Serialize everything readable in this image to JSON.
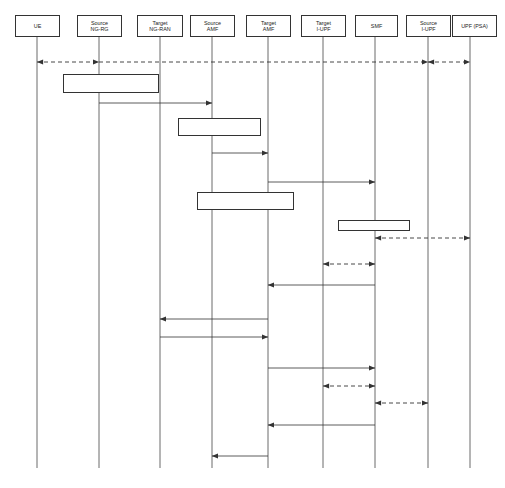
{
  "diagram": {
    "type": "uml-sequence-diagram",
    "caption": "",
    "lifelines": [
      {
        "id": "ue",
        "label": "UE",
        "line2": "",
        "x": 37,
        "box_x": 15,
        "box_w": 45
      },
      {
        "id": "src_ngrg",
        "label": "Source",
        "line2": "NG-RG",
        "x": 99,
        "box_x": 77,
        "box_w": 45
      },
      {
        "id": "tgt_ngran",
        "label": "Target",
        "line2": "NG-RAN",
        "x": 160,
        "box_x": 137,
        "box_w": 46
      },
      {
        "id": "src_amf",
        "label": "Source",
        "line2": "AMF",
        "x": 212,
        "box_x": 190,
        "box_w": 45
      },
      {
        "id": "tgt_amf",
        "label": "Target",
        "line2": "AMF",
        "x": 268,
        "box_x": 246,
        "box_w": 45
      },
      {
        "id": "tgt_iupf",
        "label": "Target",
        "line2": "I-UPF",
        "x": 323,
        "box_x": 301,
        "box_w": 45
      },
      {
        "id": "smf",
        "label": "SMF",
        "line2": "",
        "x": 375,
        "box_x": 355,
        "box_w": 43
      },
      {
        "id": "src_iupf",
        "label": "Source",
        "line2": "I-UPF",
        "x": 428,
        "box_x": 406,
        "box_w": 45
      },
      {
        "id": "upf_psa",
        "label": "UPF (PSA)",
        "line2": "",
        "x": 470,
        "box_x": 452,
        "box_w": 45
      }
    ],
    "steps": [
      {
        "id": "A",
        "label": "(A)",
        "x": 18,
        "y": 94
      },
      {
        "id": "B",
        "label": "(B)",
        "x": 165,
        "y": 131
      },
      {
        "id": "C",
        "label": "(C)",
        "x": 220,
        "y": 178
      },
      {
        "id": "D",
        "label": "(D)",
        "x": 228,
        "y": 249
      },
      {
        "id": "E",
        "label": "(E)",
        "x": 118,
        "y": 318
      },
      {
        "id": "F",
        "label": "(F)",
        "x": 228,
        "y": 389
      },
      {
        "id": "G",
        "label": "(G)",
        "x": 196,
        "y": 434
      }
    ],
    "notes": [
      {
        "id": "decision-note",
        "text": "Decision to trigger handover via N2",
        "x": 63,
        "y": 74,
        "w": 96,
        "h": 19
      },
      {
        "id": "selection-note",
        "text": "Selection of target AMF",
        "x": 178,
        "y": 118,
        "w": 83,
        "h": 18
      },
      {
        "id": "supervision-note",
        "text": "PDU Session handover supervision",
        "x": 197,
        "y": 192,
        "w": 97,
        "h": 18
      },
      {
        "id": "iupf-note",
        "text": "I-UPF selection",
        "x": 338,
        "y": 220,
        "w": 72,
        "h": 11
      }
    ],
    "messages": [
      {
        "id": "m-userplane",
        "text": "Downlink / uplink user plane data",
        "label_x": 213,
        "label_y": 49,
        "y": 62,
        "style": "dashed",
        "segments": "userplane"
      },
      {
        "id": "m-ho-req",
        "text": "Handover Required",
        "label_x": 112,
        "label_y": 95,
        "y": 103,
        "from": "src_ngrg",
        "to": "src_amf",
        "style": "solid",
        "dir": "right"
      },
      {
        "id": "m-createue-req",
        "text": "Namf_Communication_CreateUEContext Request",
        "label_x": 182,
        "label_y": 145,
        "y": 153,
        "from": "src_amf",
        "to": "tgt_amf",
        "style": "solid",
        "dir": "right"
      },
      {
        "id": "m-pdu-upd-req1",
        "text": "Nsmf_PDUSession_UpdateSMContext Request",
        "label_x": 265,
        "label_y": 174,
        "y": 182,
        "from": "tgt_amf",
        "to": "smf",
        "style": "solid",
        "dir": "right"
      },
      {
        "id": "m-n4-mod-psa",
        "text": "N4 Session Modification",
        "label_x": 385,
        "label_y": 229,
        "y": 238,
        "from": "smf",
        "to": "upf_psa",
        "style": "dashed",
        "dir": "both"
      },
      {
        "id": "m-n4-estab",
        "text": "N4 Session Establishment",
        "label_x": 308,
        "label_y": 255,
        "y": 264,
        "from": "tgt_iupf",
        "to": "smf",
        "style": "dashed",
        "dir": "both"
      },
      {
        "id": "m-pdu-upd-resp1",
        "text": "Nsmf_PDUSession_UpdateSMContext Response",
        "label_x": 265,
        "label_y": 277,
        "y": 285,
        "from": "smf",
        "to": "tgt_amf",
        "style": "solid",
        "dir": "left"
      },
      {
        "id": "m-ho-request",
        "text": "Handover Request",
        "label_x": 165,
        "label_y": 311,
        "y": 319,
        "from": "tgt_amf",
        "to": "tgt_ngran",
        "style": "solid",
        "dir": "left"
      },
      {
        "id": "m-ho-request-ack",
        "text": "Handover Request Ack",
        "label_x": 165,
        "label_y": 328,
        "y": 337,
        "from": "tgt_ngran",
        "to": "tgt_amf",
        "style": "solid",
        "dir": "right"
      },
      {
        "id": "m-pdu-upd-req2",
        "text": "Nsmf_PDUSession_UpdateSMContext Request",
        "label_x": 265,
        "label_y": 360,
        "y": 368,
        "from": "tgt_amf",
        "to": "smf",
        "style": "solid",
        "dir": "right"
      },
      {
        "id": "m-n4-mod-tgt",
        "text": "N4 Session Modification",
        "label_x": 330,
        "label_y": 377,
        "y": 386,
        "from": "tgt_iupf",
        "to": "smf",
        "style": "dashed",
        "dir": "both"
      },
      {
        "id": "m-n4-mod-src",
        "text": "N4 Session Modification",
        "label_x": 385,
        "label_y": 394,
        "y": 403,
        "from": "smf",
        "to": "src_iupf",
        "style": "dashed",
        "dir": "both"
      },
      {
        "id": "m-pdu-upd-resp2",
        "text": "Nsmf_PDUSession_UpdateSMContext Response",
        "label_x": 265,
        "label_y": 417,
        "y": 425,
        "from": "smf",
        "to": "tgt_amf",
        "style": "solid",
        "dir": "left"
      },
      {
        "id": "m-createue-resp",
        "text": "Namf_Communication_CreateUEContext Response",
        "label_x": 180,
        "label_y": 448,
        "y": 456,
        "from": "tgt_amf",
        "to": "src_amf",
        "style": "solid",
        "dir": "left"
      }
    ],
    "geometry": {
      "header_top": 15,
      "header_height": 22,
      "lifeline_top": 37,
      "lifeline_bottom": 468
    }
  }
}
